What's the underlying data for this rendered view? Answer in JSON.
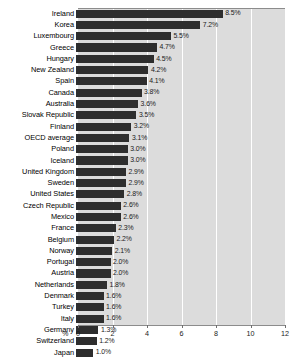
{
  "chart_data": {
    "type": "bar",
    "orientation": "horizontal",
    "title": "",
    "xlabel": "%",
    "ylabel": "",
    "xlim": [
      0,
      12
    ],
    "xticks": [
      0,
      2,
      4,
      6,
      8,
      10,
      12
    ],
    "grid": true,
    "legend": null,
    "value_suffix": "%",
    "categories": [
      "Ireland",
      "Korea",
      "Luxembourg",
      "Greece",
      "Hungary",
      "New Zealand",
      "Spain",
      "Canada",
      "Australia",
      "Slovak Republic",
      "Finland",
      "OECD average",
      "Poland",
      "Iceland",
      "United Kingdom",
      "Sweden",
      "United States",
      "Czech Republic",
      "Mexico",
      "France",
      "Belgium",
      "Norway",
      "Portugal",
      "Austria",
      "Netherlands",
      "Denmark",
      "Turkey",
      "Italy",
      "Germany",
      "Switzerland",
      "Japan"
    ],
    "values": [
      8.5,
      7.2,
      5.5,
      4.7,
      4.5,
      4.2,
      4.1,
      3.8,
      3.6,
      3.5,
      3.2,
      3.1,
      3.0,
      3.0,
      2.9,
      2.9,
      2.8,
      2.6,
      2.6,
      2.3,
      2.2,
      2.1,
      2.0,
      2.0,
      1.8,
      1.6,
      1.6,
      1.6,
      1.3,
      1.2,
      1.0
    ],
    "value_labels": [
      "8.5%",
      "7.2%",
      "5.5%",
      "4.7%",
      "4.5%",
      "4.2%",
      "4.1%",
      "3.8%",
      "3.6%",
      "3.5%",
      "3.2%",
      "3.1%",
      "3.0%",
      "3.0%",
      "2.9%",
      "2.9%",
      "2.8%",
      "2.6%",
      "2.6%",
      "2.3%",
      "2.2%",
      "2.1%",
      "2.0%",
      "2.0%",
      "1.8%",
      "1.6%",
      "1.6%",
      "1.6%",
      "1.3%",
      "1.2%",
      "1.0%"
    ],
    "tick_labels": [
      "0",
      "2",
      "4",
      "6",
      "8",
      "10",
      "12"
    ],
    "colors": {
      "bar": "#2e2e2e",
      "plot_background": "#dcdcdc",
      "gridline": "#ffffff",
      "axis": "#8c8c8c",
      "text": "#000000"
    }
  }
}
